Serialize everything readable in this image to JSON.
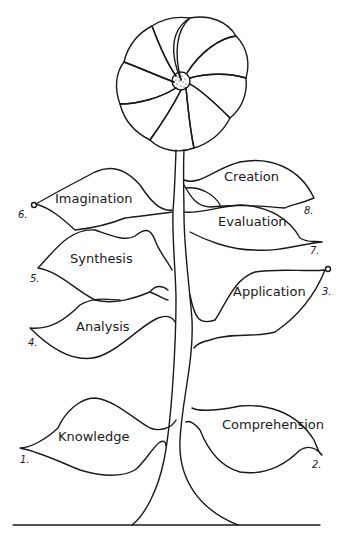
{
  "diagram": {
    "type": "hand-drawn flower illustrating a learning hierarchy",
    "flower": {
      "petals": 9,
      "center": "dotted"
    },
    "leaves": [
      {
        "number": "1.",
        "label": "Knowledge",
        "side": "left"
      },
      {
        "number": "2.",
        "label": "Comprehension",
        "side": "right"
      },
      {
        "number": "3.",
        "label": "Application",
        "side": "right"
      },
      {
        "number": "4.",
        "label": "Analysis",
        "side": "left"
      },
      {
        "number": "5.",
        "label": "Synthesis",
        "side": "left"
      },
      {
        "number": "6.",
        "label": "Imagination",
        "side": "left"
      },
      {
        "number": "7.",
        "label": "Evaluation",
        "side": "right"
      },
      {
        "number": "8.",
        "label": "Creation",
        "side": "right"
      }
    ]
  }
}
